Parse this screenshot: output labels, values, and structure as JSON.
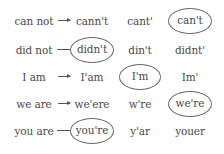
{
  "exercise": {
    "rows": [
      {
        "base": "can not",
        "options": [
          "cann't",
          "cant'",
          "can't"
        ],
        "correct_index": 2,
        "arrow_joins_circle": false
      },
      {
        "base": "did not",
        "options": [
          "didn't",
          "din't",
          "didnt'"
        ],
        "correct_index": 0,
        "arrow_joins_circle": true
      },
      {
        "base": "I am",
        "options": [
          "I'am",
          "I'm",
          "Im'"
        ],
        "correct_index": 1,
        "arrow_joins_circle": false
      },
      {
        "base": "we are",
        "options": [
          "we'ere",
          "w're",
          "we're"
        ],
        "correct_index": 2,
        "arrow_joins_circle": false
      },
      {
        "base": "you are",
        "options": [
          "you're",
          "y'ar",
          "youer"
        ],
        "correct_index": 0,
        "arrow_joins_circle": true
      }
    ],
    "colors": {
      "text": "#4a4a4a",
      "circle": "#6b6b6b",
      "background": "#ffffff"
    }
  }
}
